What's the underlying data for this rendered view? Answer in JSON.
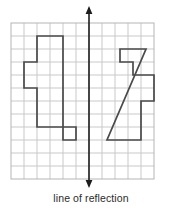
{
  "caption": {
    "text": "line of reflection"
  },
  "colors": {
    "grid_line": "#c9c9c9",
    "grid_border": "#b5b5b5",
    "shape_stroke": "#4a4a4a",
    "axis_line": "#1d1d1d",
    "caption_text": "#2b2b2b",
    "background": "#ffffff"
  },
  "chart_data": {
    "type": "diagram",
    "title": "",
    "subtitle": "",
    "xlabel": "",
    "ylabel": "",
    "grid": {
      "visible": true,
      "origin_x": 11,
      "origin_y": 23,
      "cell": 13,
      "cols": 11,
      "rows": 12,
      "width": 143,
      "height": 156
    },
    "mirror_line": {
      "label": "line of reflection",
      "orientation": "vertical",
      "grid_column": 6,
      "x": 89,
      "y_top": 8,
      "y_bottom": 186,
      "arrow_both_ends": true
    },
    "shapes": [
      {
        "name": "left-figure",
        "side": "left",
        "grid_points": [
          [
            2,
            1
          ],
          [
            4,
            1
          ],
          [
            4,
            9
          ],
          [
            5,
            9
          ],
          [
            5,
            8
          ],
          [
            2,
            8
          ],
          [
            2,
            5
          ],
          [
            1,
            5
          ],
          [
            1,
            3
          ],
          [
            2,
            3
          ]
        ],
        "pixel_points": [
          [
            37,
            36
          ],
          [
            63,
            36
          ],
          [
            63,
            140
          ],
          [
            76,
            140
          ],
          [
            76,
            127
          ],
          [
            37,
            127
          ],
          [
            37,
            88
          ],
          [
            24,
            88
          ],
          [
            24,
            62
          ],
          [
            37,
            62
          ]
        ],
        "closed": true
      },
      {
        "name": "right-figure",
        "side": "right",
        "grid_points": [
          [
            9,
            2
          ],
          [
            7,
            2
          ],
          [
            7,
            3
          ],
          [
            8,
            3
          ],
          [
            8,
            4
          ],
          [
            11,
            4
          ],
          [
            11,
            6
          ],
          [
            10,
            6
          ],
          [
            10,
            9
          ],
          [
            7,
            9
          ]
        ],
        "pixel_points": [
          [
            146,
            49
          ],
          [
            120,
            49
          ],
          [
            120,
            62
          ],
          [
            133,
            62
          ],
          [
            133,
            75
          ],
          [
            154,
            75
          ],
          [
            154,
            101
          ],
          [
            141,
            101
          ],
          [
            141,
            140
          ],
          [
            107,
            140
          ]
        ],
        "closed": true
      }
    ]
  }
}
